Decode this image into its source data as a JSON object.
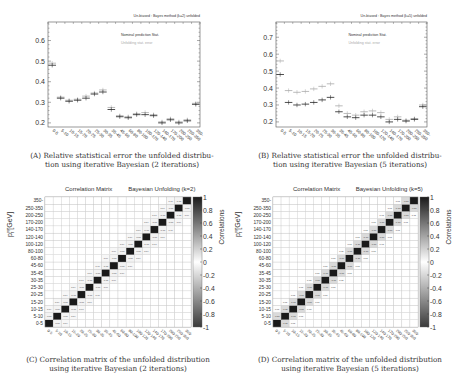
{
  "figures": {
    "a": {
      "caption_label": "(A)",
      "caption": "Relative statistical error the unfolded distribution using iterative Bayesian (2 iterations)",
      "caption_line1": "Relative statistical error the unfolded distribu-",
      "caption_line2": "tion using iterative Bayesian (2 iterations)"
    },
    "b": {
      "caption_label": "(B)",
      "caption": "Relative statistical error the unfolded distribution using iterative Bayesian (5 iterations)",
      "caption_line1": "Relative statistical error the unfolded distribu-",
      "caption_line2": "tion using iterative Bayesian (5 iterations)"
    },
    "c": {
      "caption_label": "(C)",
      "caption_line1": "Correlation matrix of the unfolded distribution",
      "caption_line2": "using iterative Bayesian (2 iterations)"
    },
    "d": {
      "caption_label": "(D)",
      "caption_line1": "Correlation matrix of the unfolded distribution",
      "caption_line2": "using iterative Bayesian (5 iterations)"
    }
  },
  "chart_data": [
    {
      "id": "a",
      "type": "scatter",
      "title": "Un-biased : Bayes method (k=2) unfolded",
      "xlabel": "p_T^{γγ}",
      "ylabel": "",
      "ylim": [
        0.18,
        0.69
      ],
      "yticks": [
        0.2,
        0.3,
        0.4,
        0.5,
        0.6
      ],
      "grid": false,
      "legend": [
        "Nominal prediction Stat.",
        "Unfolding stat. error"
      ],
      "legend_position": "upper right",
      "categories": [
        "0-5",
        "5-10",
        "10-15",
        "15-20",
        "20-25",
        "25-30",
        "30-35",
        "35-45",
        "45-60",
        "60-80",
        "80-100",
        "100-120",
        "120-140",
        "140-170",
        "170-200",
        "200-250",
        "250-350",
        "350-"
      ],
      "series": [
        {
          "name": "Nominal prediction Stat.",
          "color": "#222222",
          "values": [
            0.48,
            0.32,
            0.305,
            0.31,
            0.32,
            0.34,
            0.35,
            0.265,
            0.23,
            0.225,
            0.24,
            0.24,
            0.235,
            0.2,
            0.215,
            0.2,
            0.21,
            0.29
          ]
        },
        {
          "name": "Unfolding stat. error",
          "color": "#aaaaaa",
          "values": [
            0.49,
            0.325,
            0.31,
            0.315,
            0.33,
            0.345,
            0.36,
            0.275,
            0.235,
            0.23,
            0.245,
            0.25,
            0.24,
            0.205,
            0.22,
            0.205,
            0.215,
            0.295
          ]
        }
      ]
    },
    {
      "id": "b",
      "type": "scatter",
      "title": "Un-biased : Bayes method (k=5) unfolded",
      "xlabel": "p_T^{γγ}",
      "ylabel": "",
      "ylim": [
        0.17,
        0.79
      ],
      "yticks": [
        0.2,
        0.3,
        0.4,
        0.5,
        0.6,
        0.7
      ],
      "grid": false,
      "legend": [
        "Nominal prediction Stat.",
        "Unfolding stat. error"
      ],
      "legend_position": "upper right",
      "categories": [
        "0-5",
        "5-10",
        "10-15",
        "15-20",
        "20-25",
        "25-30",
        "30-35",
        "35-45",
        "45-60",
        "60-80",
        "80-100",
        "100-120",
        "120-140",
        "140-170",
        "170-200",
        "200-250",
        "250-350",
        "350-"
      ],
      "series": [
        {
          "name": "Nominal prediction Stat.",
          "color": "#222222",
          "values": [
            0.48,
            0.315,
            0.3,
            0.305,
            0.315,
            0.33,
            0.345,
            0.26,
            0.23,
            0.225,
            0.24,
            0.24,
            0.23,
            0.2,
            0.215,
            0.205,
            0.215,
            0.29
          ]
        },
        {
          "name": "Unfolding stat. error",
          "color": "#aaaaaa",
          "values": [
            0.56,
            0.385,
            0.375,
            0.38,
            0.395,
            0.41,
            0.425,
            0.295,
            0.25,
            0.24,
            0.26,
            0.265,
            0.255,
            0.215,
            0.23,
            0.21,
            0.22,
            0.3
          ]
        }
      ]
    },
    {
      "id": "c",
      "type": "heatmap",
      "title_left": "Correlation Matrix",
      "title_right": "Bayesian Unfolding (k=2)",
      "xlabel": "p_T^{γγ} [GeV]",
      "ylabel": "p_T^{γγ} [GeV]",
      "colorbar_label": "Correlations",
      "colorbar_ticks": [
        "1",
        "0.8",
        "0.6",
        "0.4",
        "0.2",
        "0",
        "-0.2",
        "-0.4",
        "-0.6",
        "-0.8",
        "-1"
      ],
      "zlim": [
        -1,
        1
      ],
      "categories": [
        "0-5",
        "5-10",
        "10-15",
        "15-20",
        "20-25",
        "25-30",
        "30-35",
        "35-45",
        "45-60",
        "60-80",
        "80-100",
        "100-120",
        "120-140",
        "140-170",
        "170-200",
        "200-250",
        "250-350",
        "350-"
      ],
      "diagonal": 1.0,
      "off_diagonal_1": -0.06,
      "off_diagonal_2": 0.04,
      "cell_label_samples": [
        "-0.06",
        "-0.05",
        "0.04",
        "-0.03",
        "0.02"
      ]
    },
    {
      "id": "d",
      "type": "heatmap",
      "title_left": "Correlation Matrix",
      "title_right": "Bayesian Unfolding (k=5)",
      "xlabel": "p_T^{γγ} [GeV]",
      "ylabel": "p_T^{γγ} [GeV]",
      "colorbar_label": "Correlations",
      "colorbar_ticks": [
        "1",
        "0.8",
        "0.6",
        "0.4",
        "0.2",
        "0",
        "-0.2",
        "-0.4",
        "-0.6",
        "-0.8",
        "-1"
      ],
      "zlim": [
        -1,
        1
      ],
      "categories": [
        "0-5",
        "5-10",
        "10-15",
        "15-20",
        "20-25",
        "25-30",
        "30-35",
        "35-45",
        "45-60",
        "60-80",
        "80-100",
        "100-120",
        "120-140",
        "140-170",
        "170-200",
        "200-250",
        "250-350",
        "350-"
      ],
      "diagonal": 1.0,
      "off_diagonal_1": -0.18,
      "off_diagonal_2": 0.01,
      "cell_label_samples": [
        "-0.18",
        "0.01",
        "-0.06",
        "0.07",
        "0.02"
      ]
    }
  ]
}
